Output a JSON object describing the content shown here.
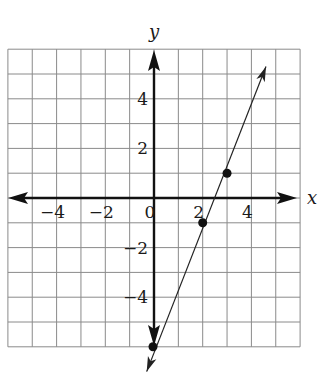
{
  "chart_data": {
    "type": "line",
    "title": "",
    "xlabel": "x",
    "ylabel": "y",
    "xlim": [
      -6,
      6
    ],
    "ylim": [
      -6,
      6
    ],
    "grid": true,
    "grid_step": 1,
    "x_tick_labels": [
      {
        "value": -4,
        "label": "−4"
      },
      {
        "value": -2,
        "label": "−2"
      },
      {
        "value": 0,
        "label": "0"
      },
      {
        "value": 2,
        "label": "2"
      },
      {
        "value": 4,
        "label": "4"
      }
    ],
    "y_tick_labels": [
      {
        "value": 4,
        "label": "4"
      },
      {
        "value": 2,
        "label": "2"
      },
      {
        "value": -2,
        "label": "−2"
      },
      {
        "value": -4,
        "label": "−4"
      }
    ],
    "series": [
      {
        "name": "line",
        "style": "line with arrows at both ends",
        "points": [
          {
            "x": 0,
            "y": -6
          },
          {
            "x": 2,
            "y": -1
          },
          {
            "x": 3,
            "y": 1
          }
        ],
        "line_extent": {
          "from": {
            "x": -0.3,
            "y": -7
          },
          "to": {
            "x": 4.6,
            "y": 5.3
          }
        }
      }
    ],
    "legend": null
  },
  "colors": {
    "grid": "#8a8a8a",
    "axis": "#111111",
    "line": "#222222",
    "background": "#ffffff"
  }
}
